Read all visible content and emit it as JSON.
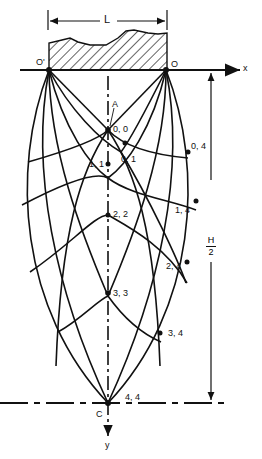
{
  "diagram": {
    "labels": {
      "length": "L",
      "origin_left": "O'",
      "origin_right": "O",
      "x_axis": "x",
      "y_axis": "y",
      "point_A": "A",
      "point_C": "C",
      "half_height_num": "H",
      "half_height_den": "2"
    },
    "nodes": [
      {
        "id": "0,0",
        "label": "0, 0"
      },
      {
        "id": "0,1",
        "label": "0, 1"
      },
      {
        "id": "1,1",
        "label": "1, 1"
      },
      {
        "id": "0,4",
        "label": "0, 4"
      },
      {
        "id": "1,4",
        "label": "1, 4"
      },
      {
        "id": "2,2",
        "label": "2, 2"
      },
      {
        "id": "2,4",
        "label": "2, 4"
      },
      {
        "id": "3,3",
        "label": "3, 3"
      },
      {
        "id": "3,4",
        "label": "3, 4"
      },
      {
        "id": "4,4",
        "label": "4, 4"
      }
    ],
    "colors": {
      "ink": "#111111",
      "background": "#ffffff"
    }
  }
}
